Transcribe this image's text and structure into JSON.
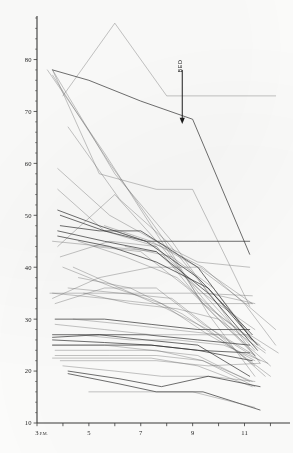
{
  "figure": {
    "title": "",
    "annotation": {
      "label": "BED",
      "arrow_name": "bed-arrow",
      "x_hour": 8.6,
      "y_top": 78,
      "y_bottom": 68
    }
  },
  "chart_data": {
    "type": "line",
    "title": "",
    "subtitle": "",
    "xlabel": "",
    "ylabel": "",
    "xlim": [
      3,
      12.6
    ],
    "ylim": [
      10,
      88
    ],
    "grid": false,
    "legend": false,
    "legend_position": "none",
    "x_tick_labels": [
      "3 P.M.",
      "5",
      "7",
      "9",
      "11"
    ],
    "x_tick_values": [
      3,
      5,
      7,
      9,
      11
    ],
    "x_minor_tick_values": [
      4,
      6,
      8,
      10,
      12
    ],
    "y_tick_labels": [
      "10",
      "20",
      "30",
      "40",
      "50",
      "60",
      "70",
      "80"
    ],
    "y_tick_values": [
      10,
      20,
      30,
      40,
      50,
      60,
      70,
      80
    ],
    "y_minor_step": 2,
    "x": [
      3,
      5,
      7,
      9,
      11
    ],
    "series": [
      {
        "name": "s01",
        "weight": "light",
        "x": [
          4,
          6,
          8,
          12.2
        ],
        "values": [
          73,
          87,
          73,
          73
        ]
      },
      {
        "name": "s02",
        "weight": "dark",
        "x": [
          3.6,
          5,
          7,
          9,
          11.2
        ],
        "values": [
          78,
          76,
          72,
          68.5,
          42.5
        ]
      },
      {
        "name": "s03",
        "weight": "light",
        "x": [
          3.6,
          6,
          8.2,
          9.6,
          11.4
        ],
        "values": [
          78,
          58,
          45,
          35,
          33
        ]
      },
      {
        "name": "s04",
        "weight": "light",
        "x": [
          3.6,
          5.4,
          7.6,
          9,
          11.2
        ],
        "values": [
          78,
          58,
          55,
          55,
          32.5
        ]
      },
      {
        "name": "s05",
        "weight": "light",
        "x": [
          3.4,
          5.6,
          7.4,
          9.4,
          11.6
        ],
        "values": [
          78,
          62,
          48,
          33,
          25
        ]
      },
      {
        "name": "s06",
        "weight": "light",
        "x": [
          4.2,
          6.2,
          8,
          9.8,
          11.6
        ],
        "values": [
          67,
          53,
          45,
          34,
          21.5
        ]
      },
      {
        "name": "s07",
        "weight": "light",
        "x": [
          3.6,
          5.8,
          7.8,
          9.6,
          11.4
        ],
        "values": [
          77,
          60,
          46,
          31,
          19
        ]
      },
      {
        "name": "s08",
        "weight": "light",
        "x": [
          3.8,
          5.8,
          7.6,
          9.2,
          11.2
        ],
        "values": [
          59,
          50,
          45,
          41,
          40
        ]
      },
      {
        "name": "s09",
        "weight": "light",
        "x": [
          3.8,
          5.6,
          7.6,
          9.4,
          11.4
        ],
        "values": [
          55,
          47,
          44,
          35,
          28
        ]
      },
      {
        "name": "s10",
        "weight": "dark",
        "x": [
          3.8,
          5.4,
          7.2,
          9.2,
          11.2
        ],
        "values": [
          51,
          48,
          45,
          45,
          45
        ]
      },
      {
        "name": "s11",
        "weight": "dark",
        "x": [
          3.9,
          5.6,
          7.2,
          9.2,
          11.3
        ],
        "values": [
          50,
          47,
          45,
          38,
          27
        ]
      },
      {
        "name": "s12",
        "weight": "dark",
        "x": [
          3.9,
          5.4,
          7.0,
          9.2,
          11.3
        ],
        "values": [
          48,
          47,
          47,
          40,
          26
        ]
      },
      {
        "name": "s13",
        "weight": "light",
        "x": [
          3.6,
          5.6,
          7.6,
          9.4,
          11.4
        ],
        "values": [
          45,
          44,
          43,
          35,
          24
        ]
      },
      {
        "name": "s14",
        "weight": "light",
        "x": [
          3.8,
          6.0,
          7.8,
          9.4,
          11.4
        ],
        "values": [
          44,
          54,
          44,
          34,
          23
        ]
      },
      {
        "name": "s15",
        "weight": "light",
        "x": [
          3.9,
          5.8,
          7.6,
          9.4,
          11.4
        ],
        "values": [
          42,
          45,
          44,
          33,
          23
        ]
      },
      {
        "name": "s16",
        "weight": "light",
        "x": [
          3.5,
          5.4,
          7.2,
          9.2,
          11.3
        ],
        "values": [
          35,
          35,
          35,
          35,
          34.5
        ]
      },
      {
        "name": "s17",
        "weight": "light",
        "x": [
          3.6,
          5.6,
          7.4,
          9.2,
          11.3
        ],
        "values": [
          35,
          34,
          33,
          33,
          33
        ]
      },
      {
        "name": "s18",
        "weight": "light",
        "x": [
          3.6,
          5.4,
          7.4,
          9.3,
          11.3
        ],
        "values": [
          34,
          38,
          40,
          40,
          33
        ]
      },
      {
        "name": "s19",
        "weight": "light",
        "x": [
          3.7,
          5.6,
          7.6,
          9.4,
          11.4
        ],
        "values": [
          33,
          36,
          36,
          29,
          23
        ]
      },
      {
        "name": "s20",
        "weight": "light",
        "x": [
          4.0,
          6.0,
          7.8,
          9.6,
          11.4
        ],
        "values": [
          40,
          36,
          33,
          27,
          22
        ]
      },
      {
        "name": "s21",
        "weight": "light",
        "x": [
          4.4,
          6.2,
          8.0,
          9.6,
          11.4
        ],
        "values": [
          40,
          36,
          32,
          28,
          21
        ]
      },
      {
        "name": "s22",
        "weight": "dark",
        "x": [
          3.7,
          5.6,
          7.4,
          9.2,
          11.2
        ],
        "values": [
          30,
          30,
          29,
          28,
          28
        ]
      },
      {
        "name": "s23",
        "weight": "light",
        "x": [
          3.7,
          5.6,
          7.4,
          9.2,
          11.2
        ],
        "values": [
          29,
          28,
          27,
          27,
          27
        ]
      },
      {
        "name": "s24",
        "weight": "dark",
        "x": [
          3.6,
          5.4,
          7.2,
          9.2,
          11.2
        ],
        "values": [
          27,
          27,
          27,
          26,
          25
        ]
      },
      {
        "name": "s25",
        "weight": "dark",
        "x": [
          3.6,
          5.4,
          7.2,
          9.2,
          11.2
        ],
        "values": [
          26.5,
          27,
          26,
          25,
          19
        ]
      },
      {
        "name": "s26",
        "weight": "dark",
        "x": [
          3.6,
          5.6,
          7.4,
          9.2,
          11.2
        ],
        "values": [
          26,
          25.5,
          25,
          24,
          23.5
        ]
      },
      {
        "name": "s27",
        "weight": "dark",
        "x": [
          3.6,
          5.6,
          7.4,
          9.2,
          11.3
        ],
        "values": [
          25,
          25,
          25,
          24,
          22
        ]
      },
      {
        "name": "s28",
        "weight": "light",
        "x": [
          3.6,
          5.6,
          7.4,
          9.2,
          11.2
        ],
        "values": [
          25,
          25,
          24,
          23,
          18
        ]
      },
      {
        "name": "s29",
        "weight": "light",
        "x": [
          3.7,
          5.8,
          7.6,
          9.4,
          11.3
        ],
        "values": [
          24,
          24,
          24,
          22,
          18
        ]
      },
      {
        "name": "s30",
        "weight": "light",
        "x": [
          3.7,
          5.8,
          7.6,
          9.4,
          11.4
        ],
        "values": [
          23,
          23,
          23,
          22,
          17
        ]
      },
      {
        "name": "s31",
        "weight": "light",
        "x": [
          3.6,
          5.6,
          7.4,
          9.2,
          11.3
        ],
        "values": [
          22.5,
          22.5,
          22.5,
          21,
          17
        ]
      },
      {
        "name": "s32",
        "weight": "light",
        "x": [
          4.0,
          6.0,
          7.8,
          9.6,
          11.4
        ],
        "values": [
          21,
          20,
          19,
          19,
          18
        ]
      },
      {
        "name": "s33",
        "weight": "dark",
        "x": [
          4.2,
          6.2,
          7.8,
          9.6,
          11.6
        ],
        "values": [
          20,
          18.5,
          17,
          19,
          17
        ]
      },
      {
        "name": "s34",
        "weight": "dark",
        "x": [
          4.2,
          6.2,
          7.6,
          9.4,
          11.6
        ],
        "values": [
          19.5,
          17.5,
          16,
          16,
          12.5
        ]
      },
      {
        "name": "s35",
        "weight": "light",
        "x": [
          3.9,
          6.0,
          7.6,
          9.6,
          11.6
        ],
        "values": [
          22,
          22,
          22,
          21,
          21.5
        ]
      },
      {
        "name": "s36",
        "weight": "light",
        "x": [
          5.0,
          7.0,
          9.0,
          11.4
        ],
        "values": [
          16,
          16,
          16,
          13
        ]
      },
      {
        "name": "s37",
        "weight": "light",
        "x": [
          4.6,
          6.4,
          8.4,
          10.2,
          11.8
        ],
        "values": [
          45,
          42,
          38,
          30,
          24
        ]
      },
      {
        "name": "s38",
        "weight": "light",
        "x": [
          4.8,
          6.6,
          8.4,
          10.0,
          11.8
        ],
        "values": [
          35,
          33,
          32,
          30,
          23.5
        ]
      },
      {
        "name": "s39",
        "weight": "light",
        "x": [
          5.2,
          7.0,
          8.8,
          10.4,
          12.0
        ],
        "values": [
          44,
          43,
          36,
          28,
          21
        ]
      },
      {
        "name": "s40",
        "weight": "light",
        "x": [
          5.6,
          7.4,
          9.2,
          10.8,
          12.2
        ],
        "values": [
          48,
          45,
          40,
          34,
          28
        ]
      },
      {
        "name": "s41",
        "weight": "light",
        "x": [
          6.0,
          7.8,
          9.4,
          11.0,
          12.2
        ],
        "values": [
          47,
          44,
          40,
          33,
          25
        ]
      },
      {
        "name": "s42",
        "weight": "light",
        "x": [
          6.4,
          8.2,
          9.8,
          11.2,
          12.3
        ],
        "values": [
          44,
          42,
          36,
          27,
          23.5
        ]
      },
      {
        "name": "s43",
        "weight": "light",
        "x": [
          4.4,
          6.4,
          8.2,
          10.0,
          11.8
        ],
        "values": [
          30,
          29,
          28,
          27,
          19
        ]
      },
      {
        "name": "s44",
        "weight": "light",
        "x": [
          4.6,
          6.6,
          8.4,
          10.2,
          11.9
        ],
        "values": [
          27,
          26,
          26,
          25,
          21.5
        ]
      },
      {
        "name": "s45",
        "weight": "dark",
        "x": [
          3.8,
          5.8,
          7.6,
          9.6,
          11.5
        ],
        "values": [
          46,
          44,
          41,
          36,
          25
        ]
      },
      {
        "name": "s46",
        "weight": "dark",
        "x": [
          3.8,
          5.6,
          7.6,
          9.6,
          11.5
        ],
        "values": [
          47,
          45,
          43,
          35,
          24
        ]
      },
      {
        "name": "s47",
        "weight": "light",
        "x": [
          4.2,
          6.2,
          8.2,
          10.0,
          11.6
        ],
        "values": [
          36,
          35,
          34,
          27,
          22
        ]
      },
      {
        "name": "s48",
        "weight": "light",
        "x": [
          4.6,
          6.6,
          8.6,
          10.4,
          12.0
        ],
        "values": [
          38,
          36,
          31,
          25,
          19
        ]
      }
    ]
  }
}
